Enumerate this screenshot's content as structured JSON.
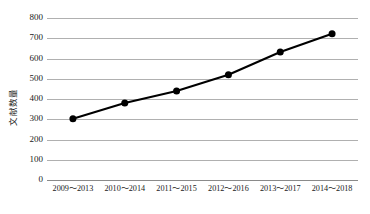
{
  "chart_data": {
    "type": "line",
    "title": "",
    "xlabel": "",
    "ylabel": "文献数量",
    "categories": [
      "2009～2013",
      "2010～2014",
      "2011～2015",
      "2012～2016",
      "2013～2017",
      "2014～2018"
    ],
    "values": [
      303,
      380,
      440,
      520,
      632,
      722
    ],
    "series": [
      {
        "name": "文献数量",
        "values": [
          303,
          380,
          440,
          520,
          632,
          722
        ]
      }
    ],
    "ylim": [
      0,
      800
    ],
    "ytick_values": [
      800,
      700,
      600,
      500,
      400,
      300,
      200,
      100,
      0
    ],
    "ytick_labels": [
      "800",
      "700",
      "600",
      "500",
      "400",
      "300",
      "200",
      "100",
      "0"
    ],
    "grid": true,
    "grid_axis": "y",
    "legend": false,
    "legend_position": "none",
    "marker": "filled-circle",
    "marker_color": "#000000",
    "line_color": "#000000",
    "grid_color": "#b0b0b0",
    "background_color": "#ffffff"
  }
}
